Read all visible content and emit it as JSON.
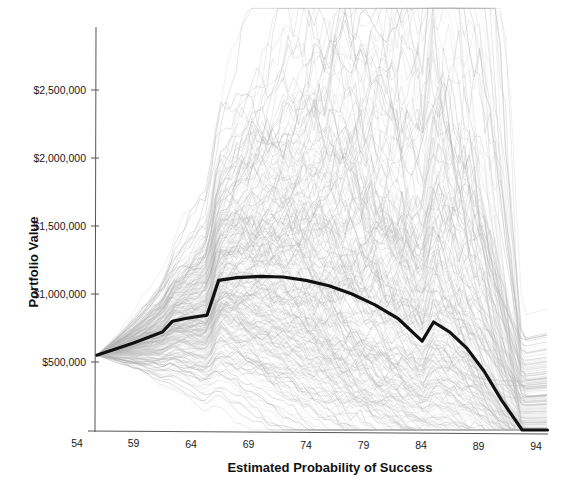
{
  "chart_data": {
    "type": "line",
    "title": "",
    "xlabel": "Estimated Probability of Success",
    "ylabel": "Portfolio Value",
    "xlim": [
      54,
      95
    ],
    "ylim": [
      0,
      2950000
    ],
    "x_ticks": [
      54,
      59,
      64,
      69,
      74,
      79,
      84,
      89,
      94
    ],
    "x_tick_labels": [
      "54",
      "59",
      "64",
      "69",
      "74",
      "79",
      "84",
      "89",
      "94"
    ],
    "y_ticks": [
      500000,
      1000000,
      1500000,
      2000000,
      2500000
    ],
    "y_tick_labels": [
      "$500,000",
      "$1,000,000",
      "$1,500,000",
      "$2,000,000",
      "$2,500,000"
    ],
    "grid": false,
    "legend": null,
    "series": [
      {
        "name": "Median simulation path",
        "color": "#111111",
        "style": "bold",
        "x": [
          55.8,
          59,
          61.5,
          62.4,
          63.5,
          65.4,
          66.4,
          68,
          70,
          72,
          74,
          76,
          78,
          80,
          82,
          84.1,
          85.1,
          86.5,
          88,
          89.5,
          91,
          92.8,
          95
        ],
        "values": [
          550000,
          640000,
          720000,
          800000,
          820000,
          845000,
          1100000,
          1120000,
          1130000,
          1125000,
          1100000,
          1060000,
          1000000,
          920000,
          820000,
          654000,
          794000,
          720000,
          600000,
          430000,
          220000,
          0,
          0
        ]
      },
      {
        "name": "Simulated portfolio paths (Monte Carlo, ~hundreds)",
        "color": "#a8a8a8",
        "style": "thin",
        "band_x": [
          55.8,
          60,
          65.4,
          66.4,
          70,
          75,
          80,
          84.1,
          85.1,
          90,
          95
        ],
        "band_low": [
          520000,
          580000,
          650000,
          900000,
          800000,
          500000,
          100000,
          0,
          0,
          0,
          0
        ],
        "band_high": [
          580000,
          820000,
          1100000,
          1450000,
          1550000,
          1600000,
          1550000,
          1400000,
          1900000,
          2050000,
          2000000
        ],
        "outlier_max": 2950000
      }
    ]
  },
  "labels": {
    "xlabel": "Estimated Probability of Success",
    "ylabel": "Portfolio Value"
  },
  "colors": {
    "median": "#111111",
    "paths": "#9a9a9a",
    "axis": "#555555",
    "background": "#ffffff"
  }
}
